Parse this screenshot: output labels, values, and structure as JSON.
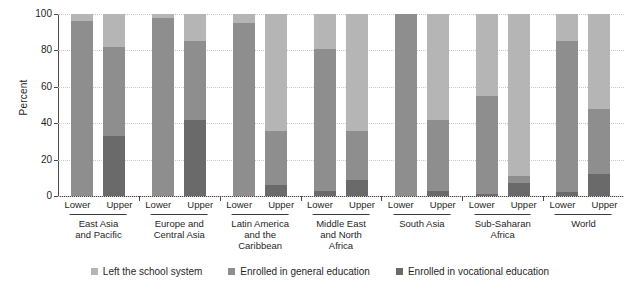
{
  "chart_data": {
    "type": "bar",
    "title": "",
    "xlabel": "",
    "ylabel": "Percent",
    "ylim": [
      0,
      100
    ],
    "yticks": [
      0,
      20,
      40,
      60,
      80,
      100
    ],
    "grid": true,
    "stacked": true,
    "legend_position": "bottom",
    "categories": [
      "East Asia and Pacific",
      "Europe and Central Asia",
      "Latin America and the Caribbean",
      "Middle East and North Africa",
      "South Asia",
      "Sub-Saharan Africa",
      "World"
    ],
    "subcategories": [
      "Lower",
      "Upper"
    ],
    "series": [
      {
        "name": "Enrolled in vocational education",
        "color": "#6a6a6a",
        "values": {
          "Lower": [
            0,
            0,
            0,
            3,
            0,
            1,
            2
          ],
          "Upper": [
            33,
            42,
            6,
            9,
            3,
            7,
            12
          ]
        }
      },
      {
        "name": "Enrolled in general education",
        "color": "#8e8e8e",
        "values": {
          "Lower": [
            96,
            98,
            95,
            78,
            100,
            54,
            83
          ],
          "Upper": [
            49,
            43,
            30,
            27,
            39,
            4,
            36
          ]
        }
      },
      {
        "name": "Left the school system",
        "color": "#b5b5b5",
        "values": {
          "Lower": [
            4,
            2,
            5,
            19,
            0,
            45,
            15
          ],
          "Upper": [
            18,
            15,
            64,
            64,
            58,
            89,
            52
          ]
        }
      }
    ]
  },
  "axis": {
    "y_title": "Percent",
    "y_tick_labels": [
      "100",
      "80",
      "60",
      "40",
      "20",
      "0"
    ]
  },
  "sublabels": {
    "lower": "Lower",
    "upper": "Upper"
  },
  "group_labels": [
    {
      "lines": [
        "East Asia",
        "and Pacific"
      ]
    },
    {
      "lines": [
        "Europe and",
        "Central Asia"
      ]
    },
    {
      "lines": [
        "Latin America",
        "and the",
        "Caribbean"
      ]
    },
    {
      "lines": [
        "Middle East",
        "and North",
        "Africa"
      ]
    },
    {
      "lines": [
        "South Asia"
      ]
    },
    {
      "lines": [
        "Sub-Saharan",
        "Africa"
      ]
    },
    {
      "lines": [
        "World"
      ]
    }
  ],
  "legend": {
    "items": [
      {
        "label": "Left the school system",
        "color": "#b5b5b5",
        "swatch": "square-swatch-icon"
      },
      {
        "label": "Enrolled in general education",
        "color": "#8e8e8e",
        "swatch": "square-swatch-icon"
      },
      {
        "label": "Enrolled in vocational education",
        "color": "#6a6a6a",
        "swatch": "square-swatch-icon"
      }
    ]
  }
}
